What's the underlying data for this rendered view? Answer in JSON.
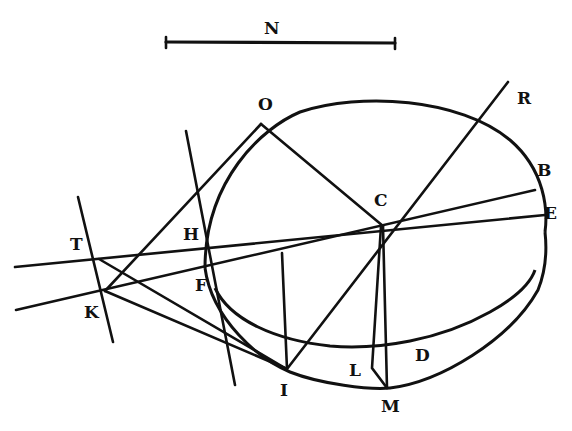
{
  "figure": {
    "type": "geometric-diagram",
    "stroke_color": "#111111",
    "background": "#ffffff"
  },
  "scale_bar": {
    "label": "N"
  },
  "points": {
    "N": "N",
    "O": "O",
    "R": "R",
    "B": "B",
    "E": "E",
    "C": "C",
    "T": "T",
    "H": "H",
    "F": "F",
    "K": "K",
    "I": "I",
    "L": "L",
    "D": "D",
    "M": "M"
  }
}
